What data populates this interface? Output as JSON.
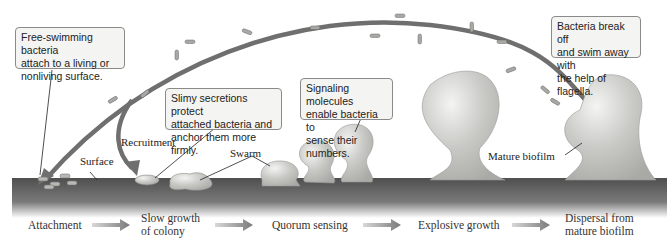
{
  "diagram": {
    "callouts": [
      {
        "id": "attach",
        "text": "Free-swimming bacteria\nattach to a living or\nnonliving surface."
      },
      {
        "id": "slime",
        "text": "Slimy secretions protect\nattached bacteria and\nanchor them more firmly."
      },
      {
        "id": "signal",
        "text": "Signaling molecules\nenable bacteria to\nsense their numbers."
      },
      {
        "id": "dispersal",
        "text": "Bacteria break off\nand swim away with\nthe help of flagella."
      }
    ],
    "labels": {
      "surface": "Surface",
      "recruitment": "Recruitment",
      "swarm": "Swarm",
      "mature_biofilm": "Mature biofilm"
    },
    "stages": [
      {
        "label": "Attachment"
      },
      {
        "label": "Slow growth\nof colony"
      },
      {
        "label": "Quorum sensing"
      },
      {
        "label": "Explosive growth"
      },
      {
        "label": "Dispersal from\nmature biofilm"
      }
    ],
    "colors": {
      "surface": "#5e5e5e",
      "arrow": "#6f6f6f",
      "biofilm": "#c9c9c6",
      "callout_bg": "#f4f4f2",
      "callout_border": "#8a8a8a"
    }
  }
}
